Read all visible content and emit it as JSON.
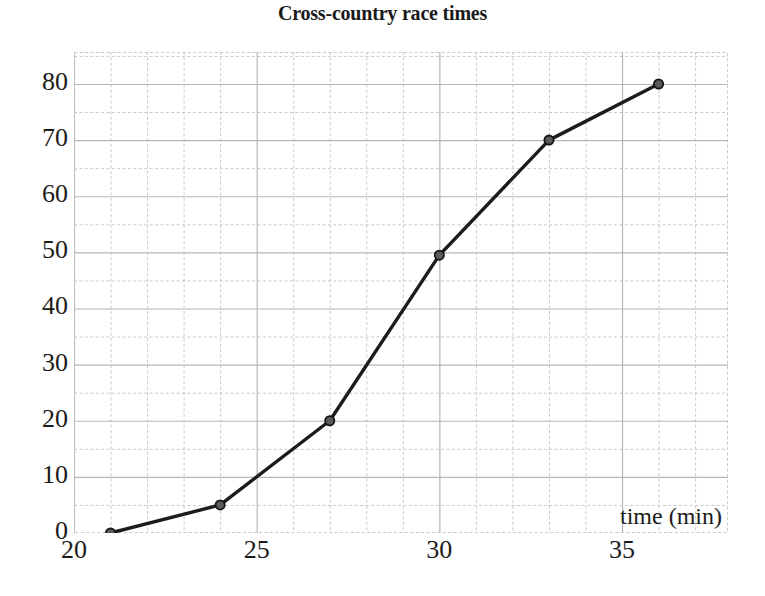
{
  "chart_data": {
    "type": "line",
    "title": "Cross-country race times",
    "xlabel": "time (min)",
    "ylabel": "",
    "xlim": [
      20,
      37.9
    ],
    "ylim": [
      0,
      85.7
    ],
    "grid": true,
    "grid_major_x_step": 5,
    "grid_minor_x_step": 1,
    "grid_major_y_step": 10,
    "grid_minor_y_step": 5,
    "legend": false,
    "xticks": [
      20,
      25,
      30,
      35
    ],
    "yticks": [
      0,
      10,
      20,
      30,
      40,
      50,
      60,
      70,
      80
    ],
    "x": [
      21,
      24,
      27,
      30,
      33,
      36
    ],
    "values": [
      0,
      5,
      20,
      49.5,
      70,
      80
    ],
    "series": [
      {
        "name": "race times",
        "x": [
          21,
          24,
          27,
          30,
          33,
          36
        ],
        "values": [
          0,
          5,
          20,
          49.5,
          70,
          80
        ]
      }
    ],
    "marker": "filled-circle",
    "line_color": "#1c1c1c",
    "marker_fill": "#5a5a5a",
    "marker_edge": "#151515",
    "grid_major_color": "#b6b6b6",
    "grid_minor_color": "#c9c9c9"
  },
  "axis": {
    "x_tick_labels": [
      "20",
      "25",
      "30",
      "35"
    ],
    "y_tick_labels": [
      "0",
      "10",
      "20",
      "30",
      "40",
      "50",
      "60",
      "70",
      "80"
    ],
    "x_title": "time (min)"
  },
  "title": {
    "text": "Cross-country race times"
  }
}
